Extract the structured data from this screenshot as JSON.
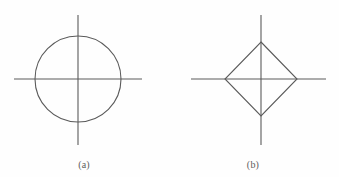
{
  "figure": {
    "background_color": "#fefefe",
    "stroke_color": "#5a5a5a",
    "caption_color": "#5d5d5d",
    "panels": [
      {
        "id": "a",
        "caption": "(a)",
        "shape": "circle",
        "center": {
          "x": 78,
          "y": 79
        },
        "radius": 43,
        "axis": {
          "horizontal": {
            "x1": 14,
            "x2": 142,
            "y": 79
          },
          "vertical": {
            "y1": 15,
            "y2": 145,
            "x": 78
          }
        }
      },
      {
        "id": "b",
        "caption": "(b)",
        "shape": "diamond",
        "center": {
          "x": 92,
          "y": 79
        },
        "half_diagonal_x": 36,
        "half_diagonal_y": 37,
        "axis": {
          "horizontal": {
            "x1": 22,
            "x2": 157,
            "y": 79
          },
          "vertical": {
            "y1": 15,
            "y2": 145,
            "x": 92
          }
        }
      }
    ]
  }
}
